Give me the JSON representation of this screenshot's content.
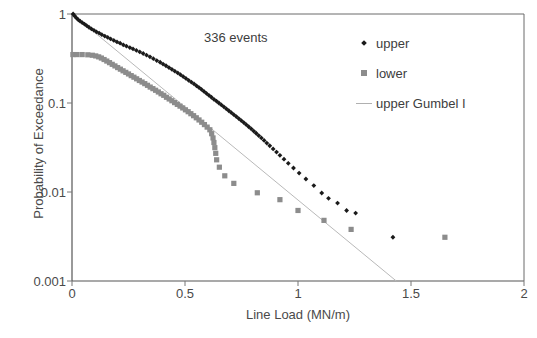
{
  "chart_data": {
    "type": "scatter",
    "title": "",
    "xlabel": "Line Load (MN/m)",
    "ylabel": "Probability of Exceedance",
    "xlim": [
      0,
      2
    ],
    "ylim": [
      0.001,
      1
    ],
    "yscale": "log",
    "xticks": [
      "0",
      "0.5",
      "1",
      "1.5",
      "2"
    ],
    "xtick_values": [
      0,
      0.5,
      1,
      1.5,
      2
    ],
    "yticks": [
      "1",
      "0.1",
      "0.01",
      "0.001"
    ],
    "ytick_values": [
      1,
      0.1,
      0.01,
      0.001
    ],
    "grid": false,
    "legend_position": "upper right",
    "annotations": [
      {
        "text": "336 events",
        "x": 0.63,
        "y": 0.52
      }
    ],
    "series": [
      {
        "name": "upper",
        "marker": "diamond",
        "color": "#1a1a1a",
        "points": [
          [
            0.005,
            1.0
          ],
          [
            0.012,
            0.95
          ],
          [
            0.02,
            0.9
          ],
          [
            0.028,
            0.86
          ],
          [
            0.036,
            0.83
          ],
          [
            0.045,
            0.8
          ],
          [
            0.055,
            0.77
          ],
          [
            0.065,
            0.74
          ],
          [
            0.075,
            0.71
          ],
          [
            0.086,
            0.68
          ],
          [
            0.097,
            0.655
          ],
          [
            0.108,
            0.63
          ],
          [
            0.12,
            0.61
          ],
          [
            0.132,
            0.585
          ],
          [
            0.145,
            0.565
          ],
          [
            0.158,
            0.545
          ],
          [
            0.171,
            0.525
          ],
          [
            0.185,
            0.505
          ],
          [
            0.199,
            0.485
          ],
          [
            0.213,
            0.47
          ],
          [
            0.227,
            0.45
          ],
          [
            0.241,
            0.435
          ],
          [
            0.256,
            0.42
          ],
          [
            0.27,
            0.405
          ],
          [
            0.285,
            0.39
          ],
          [
            0.3,
            0.375
          ],
          [
            0.315,
            0.36
          ],
          [
            0.33,
            0.345
          ],
          [
            0.345,
            0.33
          ],
          [
            0.36,
            0.315
          ],
          [
            0.375,
            0.3
          ],
          [
            0.39,
            0.287
          ],
          [
            0.403,
            0.274
          ],
          [
            0.416,
            0.262
          ],
          [
            0.429,
            0.25
          ],
          [
            0.442,
            0.239
          ],
          [
            0.455,
            0.228
          ],
          [
            0.468,
            0.218
          ],
          [
            0.48,
            0.208
          ],
          [
            0.492,
            0.198
          ],
          [
            0.504,
            0.189
          ],
          [
            0.516,
            0.18
          ],
          [
            0.528,
            0.172
          ],
          [
            0.54,
            0.164
          ],
          [
            0.551,
            0.156
          ],
          [
            0.562,
            0.149
          ],
          [
            0.573,
            0.142
          ],
          [
            0.584,
            0.135
          ],
          [
            0.595,
            0.128
          ],
          [
            0.606,
            0.122
          ],
          [
            0.617,
            0.116
          ],
          [
            0.628,
            0.11
          ],
          [
            0.639,
            0.105
          ],
          [
            0.65,
            0.1
          ],
          [
            0.661,
            0.0952
          ],
          [
            0.672,
            0.0905
          ],
          [
            0.683,
            0.086
          ],
          [
            0.694,
            0.0818
          ],
          [
            0.705,
            0.0778
          ],
          [
            0.716,
            0.074
          ],
          [
            0.727,
            0.0703
          ],
          [
            0.738,
            0.0668
          ],
          [
            0.749,
            0.0634
          ],
          [
            0.76,
            0.0602
          ],
          [
            0.771,
            0.0571
          ],
          [
            0.782,
            0.0541
          ],
          [
            0.793,
            0.0512
          ],
          [
            0.804,
            0.0484
          ],
          [
            0.815,
            0.0457
          ],
          [
            0.826,
            0.0431
          ],
          [
            0.838,
            0.0405
          ],
          [
            0.85,
            0.038
          ],
          [
            0.862,
            0.0355
          ],
          [
            0.875,
            0.0331
          ],
          [
            0.89,
            0.0305
          ],
          [
            0.905,
            0.0281
          ],
          [
            0.92,
            0.0258
          ],
          [
            0.938,
            0.0234
          ],
          [
            0.957,
            0.021
          ],
          [
            0.98,
            0.0186
          ],
          [
            1.005,
            0.0163
          ],
          [
            1.035,
            0.014
          ],
          [
            1.07,
            0.0118
          ],
          [
            1.105,
            0.00975
          ],
          [
            1.135,
            0.0085
          ],
          [
            1.175,
            0.0075
          ],
          [
            1.215,
            0.0062
          ],
          [
            1.255,
            0.0058
          ],
          [
            1.42,
            0.0031
          ]
        ]
      },
      {
        "name": "lower",
        "marker": "square",
        "color": "#8c8c8c",
        "points": [
          [
            0.004,
            0.35
          ],
          [
            0.022,
            0.35
          ],
          [
            0.045,
            0.35
          ],
          [
            0.07,
            0.348
          ],
          [
            0.09,
            0.344
          ],
          [
            0.105,
            0.338
          ],
          [
            0.118,
            0.33
          ],
          [
            0.13,
            0.32
          ],
          [
            0.142,
            0.308
          ],
          [
            0.154,
            0.296
          ],
          [
            0.166,
            0.284
          ],
          [
            0.178,
            0.272
          ],
          [
            0.19,
            0.261
          ],
          [
            0.202,
            0.25
          ],
          [
            0.214,
            0.24
          ],
          [
            0.226,
            0.23
          ],
          [
            0.238,
            0.221
          ],
          [
            0.25,
            0.212
          ],
          [
            0.262,
            0.203
          ],
          [
            0.274,
            0.195
          ],
          [
            0.286,
            0.187
          ],
          [
            0.298,
            0.179
          ],
          [
            0.31,
            0.172
          ],
          [
            0.322,
            0.165
          ],
          [
            0.334,
            0.158
          ],
          [
            0.346,
            0.151
          ],
          [
            0.358,
            0.145
          ],
          [
            0.37,
            0.139
          ],
          [
            0.382,
            0.133
          ],
          [
            0.394,
            0.127
          ],
          [
            0.406,
            0.122
          ],
          [
            0.418,
            0.116
          ],
          [
            0.43,
            0.111
          ],
          [
            0.442,
            0.106
          ],
          [
            0.454,
            0.101
          ],
          [
            0.466,
            0.0965
          ],
          [
            0.478,
            0.0922
          ],
          [
            0.49,
            0.088
          ],
          [
            0.502,
            0.0838
          ],
          [
            0.514,
            0.0798
          ],
          [
            0.526,
            0.0758
          ],
          [
            0.538,
            0.072
          ],
          [
            0.55,
            0.0682
          ],
          [
            0.562,
            0.0645
          ],
          [
            0.574,
            0.0608
          ],
          [
            0.586,
            0.0572
          ],
          [
            0.598,
            0.0536
          ],
          [
            0.61,
            0.05
          ],
          [
            0.618,
            0.0452
          ],
          [
            0.624,
            0.0405
          ],
          [
            0.628,
            0.036
          ],
          [
            0.632,
            0.0315
          ],
          [
            0.636,
            0.0272
          ],
          [
            0.64,
            0.023
          ],
          [
            0.652,
            0.019
          ],
          [
            0.676,
            0.0152
          ],
          [
            0.716,
            0.0125
          ],
          [
            0.82,
            0.0098
          ],
          [
            0.92,
            0.0082
          ],
          [
            1.0,
            0.0062
          ],
          [
            1.115,
            0.0048
          ],
          [
            1.235,
            0.0038
          ],
          [
            1.65,
            0.0031
          ]
        ]
      }
    ],
    "fit_line": {
      "name": "upper Gumbel I",
      "color": "#b9b9b9",
      "style": "solid",
      "points": [
        [
          0.1,
          0.62
        ],
        [
          1.435,
          0.001
        ]
      ]
    },
    "legend": [
      {
        "label": "upper",
        "marker": "diamond",
        "color": "#1a1a1a"
      },
      {
        "label": "lower",
        "marker": "square",
        "color": "#8c8c8c"
      },
      {
        "label": "upper Gumbel I",
        "marker": "line",
        "color": "#b9b9b9"
      }
    ]
  },
  "axes": {
    "frame_color": "#555555"
  }
}
